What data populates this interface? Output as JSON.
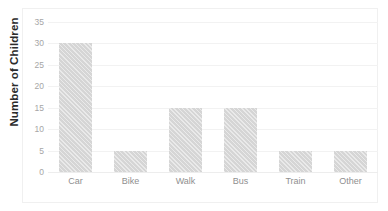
{
  "chart_data": {
    "type": "bar",
    "title": "",
    "xlabel": "",
    "ylabel": "Number of Children",
    "categories": [
      "Car",
      "Bike",
      "Walk",
      "Bus",
      "Train",
      "Other"
    ],
    "values": [
      30,
      5,
      15,
      15,
      5,
      5
    ],
    "ylim": [
      0,
      35
    ],
    "ytick_labels": [
      "0",
      "5",
      "10",
      "15",
      "20",
      "25",
      "30",
      "35"
    ],
    "ytick_values": [
      0,
      5,
      10,
      15,
      20,
      25,
      30,
      35
    ],
    "grid": "horizontal",
    "legend": "none",
    "bar_color": "#d8d8d8",
    "gridline_color": "#f2f2f2",
    "axis_label_color": "#a6a6a6",
    "axis_title_color": "#2b2b2b"
  }
}
